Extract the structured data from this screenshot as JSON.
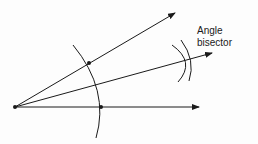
{
  "diagram": {
    "label_line1": "Angle",
    "label_line2": "bisector",
    "stroke_color": "#1a1a1a"
  }
}
